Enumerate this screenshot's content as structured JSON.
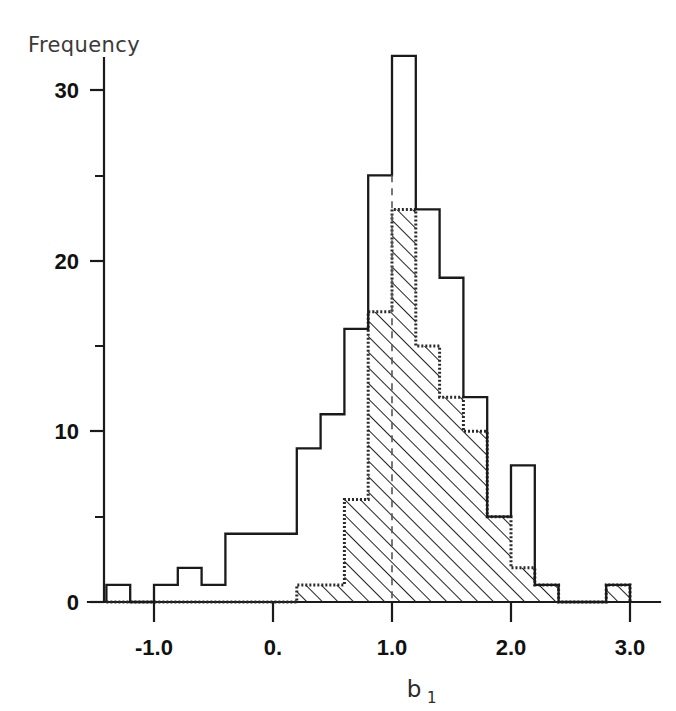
{
  "chart_data": {
    "type": "bar",
    "title": "",
    "subtitle": "",
    "xlabel": "b₁",
    "xlabel_base": "b",
    "xlabel_sub": "1",
    "ylabel": "Frequency",
    "xlim": [
      -1.5,
      3.1
    ],
    "ylim": [
      0,
      34
    ],
    "grid": false,
    "legend": "none",
    "bin_width": 0.2,
    "bin_edges": [
      -1.4,
      -1.2,
      -1.0,
      -0.8,
      -0.6,
      -0.4,
      -0.2,
      0.0,
      0.2,
      0.4,
      0.6,
      0.8,
      1.0,
      1.2,
      1.4,
      1.6,
      1.8,
      2.0,
      2.2,
      2.4,
      2.6,
      2.8,
      3.0
    ],
    "xticks": [
      -1.0,
      0.0,
      1.0,
      2.0,
      3.0
    ],
    "xtick_labels": [
      "-1.0",
      "0.",
      "1.0",
      "2.0",
      "3.0"
    ],
    "yticks": [
      0,
      10,
      20,
      30
    ],
    "ytick_labels": [
      "0",
      "10",
      "20",
      "30"
    ],
    "yticks_minor": [
      5,
      15,
      25,
      35
    ],
    "series": [
      {
        "name": "all",
        "style": "outline",
        "color": "#1a1a1a",
        "values": [
          1,
          0,
          1,
          2,
          1,
          4,
          4,
          4,
          9,
          11,
          16,
          25,
          32,
          23,
          19,
          12,
          5,
          8,
          1,
          0,
          0,
          1
        ]
      },
      {
        "name": "subset",
        "style": "hatched",
        "color": "#2a2a2a",
        "values": [
          0,
          0,
          0,
          0,
          0,
          0,
          0,
          0,
          1,
          1,
          6,
          17,
          23,
          15,
          12,
          10,
          5,
          2,
          1,
          0,
          0,
          1
        ]
      }
    ]
  },
  "axis": {
    "y_title": "Frequency",
    "x_title_base": "b",
    "x_title_sub": "1"
  }
}
